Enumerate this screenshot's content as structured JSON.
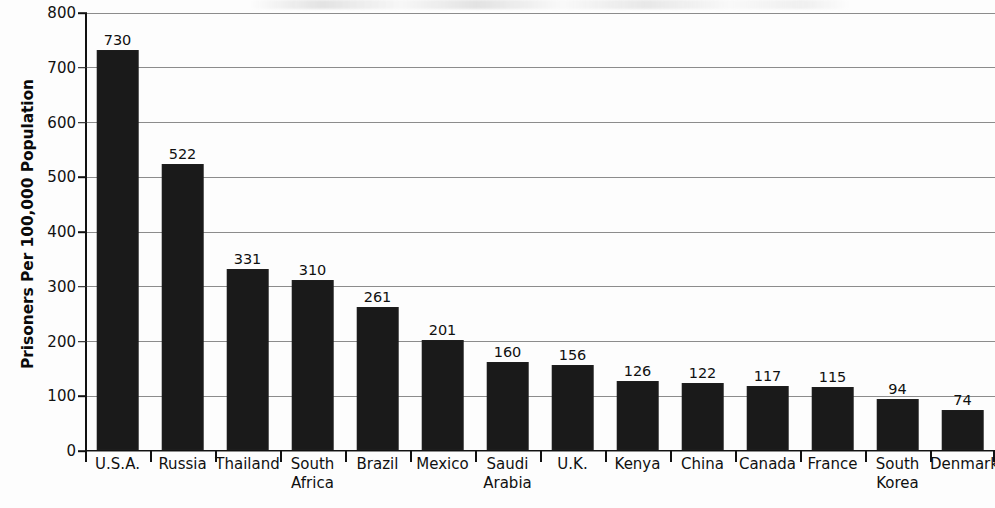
{
  "chart_data": {
    "type": "bar",
    "title": "",
    "xlabel": "",
    "ylabel": "Prisoners Per 100,000 Population",
    "ylim": [
      0,
      800
    ],
    "ytick_step": 100,
    "yticks": [
      0,
      100,
      200,
      300,
      400,
      500,
      600,
      700,
      800
    ],
    "grid": true,
    "legend": "none",
    "bar_color": "#1a1a1a",
    "gridline_color": "#8c8c8c",
    "axis_color": "#111111",
    "categories": [
      "U.S.A.",
      "Russia",
      "Thailand",
      "South\nAfrica",
      "Brazil",
      "Mexico",
      "Saudi\nArabia",
      "U.K.",
      "Kenya",
      "China",
      "Canada",
      "France",
      "South\nKorea",
      "Denmark"
    ],
    "values": [
      730,
      522,
      331,
      310,
      261,
      201,
      160,
      156,
      126,
      122,
      117,
      115,
      94,
      74
    ],
    "value_labels": [
      "730",
      "522",
      "331",
      "310",
      "261",
      "201",
      "160",
      "156",
      "126",
      "122",
      "117",
      "115",
      "94",
      "74"
    ],
    "ytick_labels": [
      "0",
      "100",
      "200",
      "300",
      "400",
      "500",
      "600",
      "700",
      "800"
    ]
  }
}
